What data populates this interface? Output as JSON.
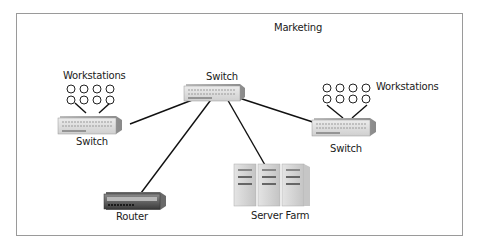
{
  "diagram": {
    "title_label": "Marketing",
    "nodes": {
      "switch_center": {
        "label": "Switch"
      },
      "switch_left": {
        "label": "Switch"
      },
      "switch_right": {
        "label": "Switch"
      },
      "workstations_left": {
        "label": "Workstations",
        "count": 8
      },
      "workstations_right": {
        "label": "Workstations",
        "count": 8
      },
      "router": {
        "label": "Router"
      },
      "server_farm": {
        "label": "Server Farm",
        "servers": 3
      }
    },
    "links": [
      [
        "switch_center",
        "switch_left"
      ],
      [
        "switch_center",
        "switch_right"
      ],
      [
        "switch_center",
        "router"
      ],
      [
        "switch_center",
        "server_farm"
      ],
      [
        "switch_left",
        "workstations_left"
      ],
      [
        "switch_right",
        "workstations_right"
      ]
    ],
    "colors": {
      "frame_border": "#9a9a9a",
      "line": "#111111",
      "device_light": "#d8d8d8",
      "device_dark": "#555555"
    }
  }
}
